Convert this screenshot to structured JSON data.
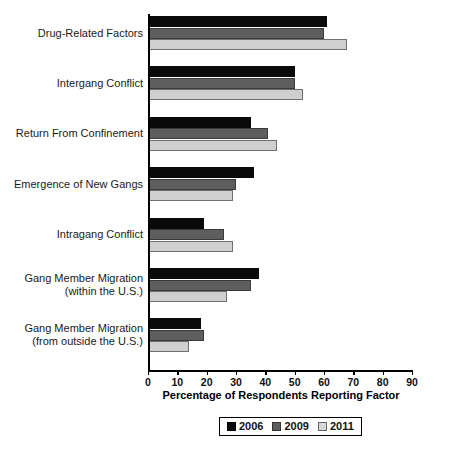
{
  "chart_data": {
    "type": "bar",
    "orientation": "horizontal",
    "title": "",
    "xlabel": "Percentage of Respondents Reporting Factor",
    "ylabel": "",
    "xlim": [
      0,
      90
    ],
    "xticks": [
      0,
      10,
      20,
      30,
      40,
      50,
      60,
      70,
      80,
      90
    ],
    "grid": false,
    "legend_position": "bottom-center",
    "categories": [
      "Drug-Related Factors",
      "Intergang Conflict",
      "Return From Confinement",
      "Emergence of New Gangs",
      "Intragang Conflict",
      "Gang Member Migration (within the U.S.)",
      "Gang Member Migration (from outside the U.S.)"
    ],
    "category_lines": [
      [
        "Drug-Related Factors"
      ],
      [
        "Intergang Conflict"
      ],
      [
        "Return From Confinement"
      ],
      [
        "Emergence of New Gangs"
      ],
      [
        "Intragang Conflict"
      ],
      [
        "Gang Member Migration",
        "(within the U.S.)"
      ],
      [
        "Gang Member Migration",
        "(from outside the U.S.)"
      ]
    ],
    "series": [
      {
        "name": "2006",
        "color": "#0a0a0a",
        "values": [
          61,
          50,
          35,
          36,
          19,
          38,
          18
        ]
      },
      {
        "name": "2009",
        "color": "#5e5e5e",
        "values": [
          60,
          50,
          41,
          30,
          26,
          35,
          19
        ]
      },
      {
        "name": "2011",
        "color": "#cfcfcf",
        "values": [
          68,
          53,
          44,
          29,
          29,
          27,
          14
        ]
      }
    ]
  },
  "legend": {
    "entries": [
      {
        "label": "2006"
      },
      {
        "label": "2009"
      },
      {
        "label": "2011"
      }
    ]
  }
}
